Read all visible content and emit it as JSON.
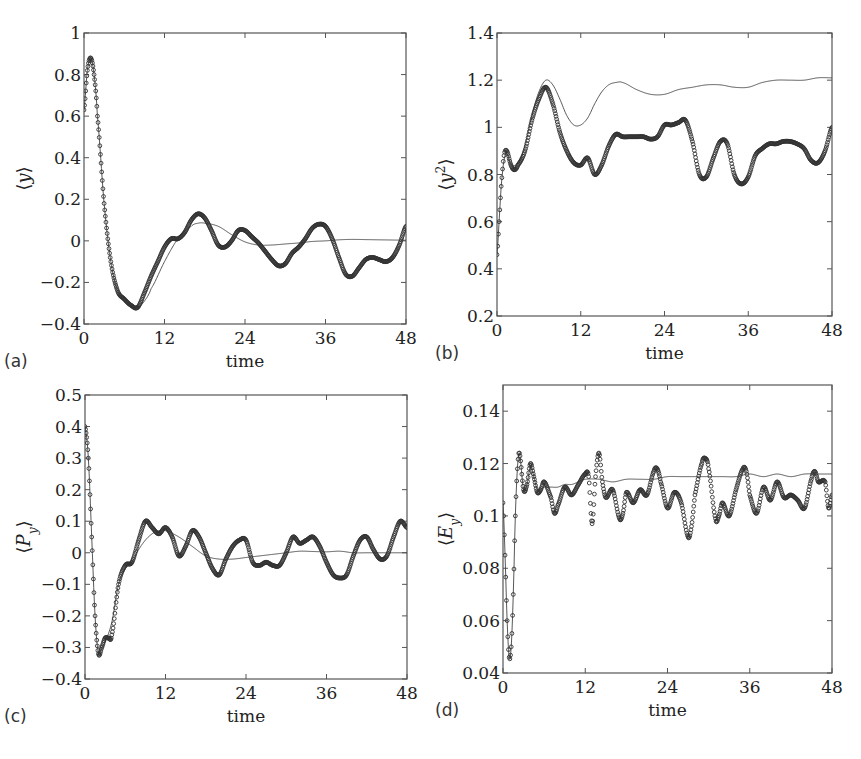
{
  "figure": {
    "background": "#ffffff",
    "axis_color": "#555555",
    "marker_color": "#333333",
    "line_color": "#444444"
  },
  "chart_data": [
    {
      "type": "line",
      "panel": "(a)",
      "title": "",
      "xlabel": "time",
      "ylabel": "⟨y⟩",
      "xlim": [
        0,
        48
      ],
      "ylim": [
        -0.4,
        1
      ],
      "xticks": [
        0,
        12,
        24,
        36,
        48
      ],
      "xtick_labels": [
        "0",
        "12",
        "24",
        "36",
        "48"
      ],
      "yticks": [
        -0.4,
        -0.2,
        0,
        0.2,
        0.4,
        0.6,
        0.8,
        1
      ],
      "ytick_labels": [
        "−0.4",
        "−0.2",
        "0",
        "0.2",
        "0.4",
        "0.6",
        "0.8",
        "1"
      ],
      "grid": false,
      "box": {
        "left": 84,
        "top": 33,
        "right": 406,
        "bottom": 324
      },
      "series": [
        {
          "name": "exact (circles)",
          "style": "markers",
          "x": [
            0,
            0.5,
            1,
            1.5,
            2,
            3,
            4,
            5,
            6,
            7,
            8,
            9,
            10,
            11,
            12,
            13,
            14,
            15,
            16,
            17,
            18,
            19,
            20,
            21,
            22,
            23,
            24,
            25,
            26,
            27,
            28,
            29,
            30,
            31,
            32,
            33,
            34,
            35,
            36,
            37,
            38,
            39,
            40,
            41,
            42,
            43,
            44,
            45,
            46,
            47,
            48
          ],
          "y": [
            0.63,
            0.82,
            0.88,
            0.8,
            0.6,
            0.18,
            -0.1,
            -0.24,
            -0.28,
            -0.31,
            -0.32,
            -0.25,
            -0.17,
            -0.1,
            -0.03,
            0.01,
            0.01,
            0.04,
            0.1,
            0.13,
            0.11,
            0.05,
            -0.02,
            -0.03,
            0.0,
            0.05,
            0.05,
            0.02,
            -0.01,
            -0.05,
            -0.09,
            -0.12,
            -0.11,
            -0.06,
            -0.03,
            0.01,
            0.06,
            0.08,
            0.07,
            0.01,
            -0.08,
            -0.16,
            -0.17,
            -0.13,
            -0.09,
            -0.08,
            -0.09,
            -0.1,
            -0.08,
            -0.02,
            0.07
          ]
        },
        {
          "name": "approximation (line)",
          "style": "line",
          "x": [
            0,
            0.5,
            1,
            1.5,
            2,
            3,
            4,
            5,
            6,
            7,
            8,
            9,
            10,
            12,
            14,
            16,
            17,
            18,
            20,
            22,
            24,
            26,
            28,
            30,
            32,
            34,
            36,
            38,
            40,
            42,
            44,
            46,
            48
          ],
          "y": [
            0.63,
            0.82,
            0.88,
            0.8,
            0.6,
            0.18,
            -0.1,
            -0.24,
            -0.28,
            -0.31,
            -0.32,
            -0.29,
            -0.23,
            -0.1,
            0.01,
            0.07,
            0.085,
            0.085,
            0.07,
            0.03,
            -0.005,
            -0.02,
            -0.02,
            -0.015,
            -0.01,
            -0.003,
            0.0,
            0.005,
            0.007,
            0.006,
            0.005,
            0.004,
            0.003
          ]
        }
      ]
    },
    {
      "type": "line",
      "panel": "(b)",
      "title": "",
      "xlabel": "time",
      "ylabel": "⟨y²⟩",
      "xlim": [
        0,
        48
      ],
      "ylim": [
        0.2,
        1.4
      ],
      "xticks": [
        0,
        12,
        24,
        36,
        48
      ],
      "xtick_labels": [
        "0",
        "12",
        "24",
        "36",
        "48"
      ],
      "yticks": [
        0.2,
        0.4,
        0.6,
        0.8,
        1,
        1.2,
        1.4
      ],
      "ytick_labels": [
        "0.2",
        "0.4",
        "0.6",
        "0.8",
        "1",
        "1.2",
        "1.4"
      ],
      "grid": false,
      "box": {
        "left": 497,
        "top": 33,
        "right": 832,
        "bottom": 316
      },
      "series": [
        {
          "name": "exact (circles)",
          "style": "markers",
          "x": [
            0,
            0.3,
            0.6,
            1,
            1.4,
            2,
            2.5,
            3,
            4,
            5,
            6,
            7,
            8,
            9,
            10,
            11,
            12,
            13,
            14,
            15,
            16,
            17,
            18,
            19,
            20,
            21,
            22,
            23,
            24,
            25,
            26,
            27,
            28,
            29,
            30,
            31,
            32,
            33,
            34,
            35,
            36,
            37,
            38,
            39,
            40,
            41,
            42,
            43,
            44,
            45,
            46,
            47,
            48
          ],
          "y": [
            0.46,
            0.6,
            0.75,
            0.88,
            0.9,
            0.84,
            0.82,
            0.84,
            0.9,
            1.03,
            1.12,
            1.17,
            1.1,
            0.98,
            0.9,
            0.85,
            0.84,
            0.87,
            0.8,
            0.84,
            0.92,
            0.97,
            0.96,
            0.96,
            0.96,
            0.96,
            0.95,
            0.96,
            1.01,
            1.01,
            1.02,
            1.03,
            0.94,
            0.8,
            0.79,
            0.87,
            0.94,
            0.93,
            0.8,
            0.76,
            0.79,
            0.88,
            0.91,
            0.93,
            0.93,
            0.94,
            0.94,
            0.93,
            0.91,
            0.86,
            0.85,
            0.9,
            1.0
          ]
        },
        {
          "name": "approximation (line)",
          "style": "line",
          "x": [
            0,
            0.3,
            0.6,
            1,
            1.4,
            2,
            3,
            4,
            5,
            6,
            7,
            8,
            9,
            10,
            11,
            12,
            13,
            14,
            15,
            16,
            17,
            18,
            20,
            22,
            24,
            26,
            28,
            30,
            32,
            34,
            36,
            38,
            40,
            42,
            44,
            46,
            48
          ],
          "y": [
            0.46,
            0.6,
            0.75,
            0.86,
            0.89,
            0.84,
            0.85,
            0.92,
            1.05,
            1.15,
            1.2,
            1.18,
            1.12,
            1.05,
            1.01,
            1.01,
            1.04,
            1.1,
            1.15,
            1.18,
            1.19,
            1.19,
            1.16,
            1.14,
            1.14,
            1.16,
            1.17,
            1.18,
            1.18,
            1.17,
            1.17,
            1.19,
            1.2,
            1.2,
            1.2,
            1.21,
            1.21
          ]
        }
      ]
    },
    {
      "type": "line",
      "panel": "(c)",
      "title": "",
      "xlabel": "time",
      "ylabel": "⟨P_y⟩",
      "xlim": [
        0,
        48
      ],
      "ylim": [
        -0.4,
        0.5
      ],
      "xticks": [
        0,
        12,
        24,
        36,
        48
      ],
      "xtick_labels": [
        "0",
        "12",
        "24",
        "36",
        "48"
      ],
      "yticks": [
        -0.4,
        -0.3,
        -0.2,
        -0.1,
        0,
        0.1,
        0.2,
        0.3,
        0.4,
        0.5
      ],
      "ytick_labels": [
        "−0.4",
        "−0.3",
        "−0.2",
        "−0.1",
        "0",
        "0.1",
        "0.2",
        "0.3",
        "0.4",
        "0.5"
      ],
      "grid": false,
      "box": {
        "left": 85,
        "top": 395,
        "right": 407,
        "bottom": 679
      },
      "series": [
        {
          "name": "exact (circles)",
          "style": "markers",
          "x": [
            0,
            0.5,
            1,
            1.5,
            2,
            2.5,
            3,
            3.5,
            4,
            5,
            6,
            7,
            8,
            9,
            10,
            11,
            12,
            13,
            14,
            15,
            16,
            17,
            18,
            19,
            20,
            21,
            22,
            23,
            24,
            25,
            26,
            27,
            28,
            29,
            30,
            31,
            32,
            33,
            34,
            35,
            36,
            37,
            38,
            39,
            40,
            41,
            42,
            43,
            44,
            45,
            46,
            47,
            48
          ],
          "y": [
            0.4,
            0.3,
            0.05,
            -0.2,
            -0.32,
            -0.3,
            -0.27,
            -0.27,
            -0.26,
            -0.1,
            -0.04,
            -0.03,
            0.04,
            0.1,
            0.08,
            0.06,
            0.08,
            0.05,
            -0.01,
            0.02,
            0.07,
            0.05,
            0.0,
            -0.05,
            -0.07,
            -0.02,
            0.02,
            0.04,
            0.04,
            -0.03,
            -0.04,
            -0.03,
            -0.04,
            -0.04,
            0.0,
            0.05,
            0.03,
            0.04,
            0.05,
            0.02,
            -0.03,
            -0.07,
            -0.08,
            -0.07,
            -0.01,
            0.04,
            0.05,
            0.01,
            -0.02,
            -0.01,
            0.05,
            0.1,
            0.08
          ]
        },
        {
          "name": "approximation (line)",
          "style": "line",
          "x": [
            0,
            0.5,
            1,
            1.5,
            2,
            2.5,
            3,
            4,
            5,
            6,
            7,
            8,
            9,
            10,
            11,
            12,
            14,
            16,
            18,
            20,
            22,
            24,
            26,
            28,
            30,
            32,
            34,
            36,
            38,
            40,
            42,
            44,
            46,
            48
          ],
          "y": [
            0.4,
            0.3,
            0.05,
            -0.2,
            -0.32,
            -0.3,
            -0.28,
            -0.22,
            -0.1,
            -0.05,
            -0.03,
            0.01,
            0.04,
            0.06,
            0.07,
            0.07,
            0.05,
            0.02,
            -0.01,
            -0.02,
            -0.02,
            -0.015,
            -0.01,
            -0.005,
            0.0,
            0.005,
            0.004,
            0.003,
            0.005,
            0.0,
            0.0,
            0.0,
            0.0,
            0.0
          ]
        }
      ]
    },
    {
      "type": "line",
      "panel": "(d)",
      "title": "",
      "xlabel": "time",
      "ylabel": "⟨E_y⟩",
      "xlim": [
        0,
        48
      ],
      "ylim": [
        0.04,
        0.15
      ],
      "xticks": [
        0,
        12,
        24,
        36,
        48
      ],
      "xtick_labels": [
        "0",
        "12",
        "24",
        "36",
        "48"
      ],
      "yticks": [
        0.04,
        0.06,
        0.08,
        0.1,
        0.12,
        0.14
      ],
      "ytick_labels": [
        "0.04",
        "0.06",
        "0.08",
        "0.1",
        "0.12",
        "0.14"
      ],
      "grid": false,
      "box": {
        "left": 503,
        "top": 385,
        "right": 832,
        "bottom": 673
      },
      "series": [
        {
          "name": "exact (circles)",
          "style": "markers",
          "x": [
            0,
            0.3,
            0.6,
            0.9,
            1.2,
            1.5,
            1.8,
            2.1,
            2.4,
            3,
            3.5,
            4,
            4.5,
            5,
            5.5,
            6,
            7,
            7.5,
            8,
            9,
            10,
            11,
            12,
            12.5,
            13,
            13.5,
            14,
            14.5,
            15,
            16,
            17,
            17.5,
            18,
            19,
            20,
            21,
            22,
            22.5,
            23,
            24,
            25,
            26,
            27,
            27.5,
            28,
            29,
            29.5,
            30,
            31,
            31.5,
            32,
            33,
            34,
            35,
            35.5,
            36,
            37,
            38,
            39,
            40,
            41,
            42,
            43,
            44,
            45,
            45.5,
            46,
            47,
            47.5,
            48
          ],
          "y": [
            0.105,
            0.085,
            0.06,
            0.046,
            0.05,
            0.07,
            0.1,
            0.118,
            0.124,
            0.11,
            0.112,
            0.12,
            0.115,
            0.109,
            0.11,
            0.113,
            0.107,
            0.101,
            0.104,
            0.111,
            0.108,
            0.112,
            0.116,
            0.115,
            0.097,
            0.115,
            0.124,
            0.113,
            0.107,
            0.11,
            0.099,
            0.101,
            0.109,
            0.105,
            0.11,
            0.108,
            0.117,
            0.118,
            0.113,
            0.103,
            0.109,
            0.105,
            0.092,
            0.096,
            0.108,
            0.12,
            0.122,
            0.118,
            0.099,
            0.1,
            0.105,
            0.1,
            0.11,
            0.118,
            0.117,
            0.108,
            0.101,
            0.111,
            0.106,
            0.113,
            0.107,
            0.108,
            0.106,
            0.103,
            0.114,
            0.117,
            0.113,
            0.113,
            0.103,
            0.108
          ]
        },
        {
          "name": "approximation (line)",
          "style": "line",
          "x": [
            0,
            0.3,
            0.6,
            0.9,
            1.2,
            1.5,
            1.8,
            2.1,
            2.4,
            3,
            3.5,
            4,
            4.5,
            5,
            6,
            7,
            8,
            9,
            10,
            11,
            12,
            14,
            16,
            18,
            20,
            22,
            24,
            26,
            28,
            30,
            32,
            34,
            36,
            38,
            40,
            42,
            44,
            46,
            48
          ],
          "y": [
            0.105,
            0.085,
            0.06,
            0.046,
            0.05,
            0.07,
            0.1,
            0.118,
            0.124,
            0.11,
            0.112,
            0.119,
            0.115,
            0.11,
            0.111,
            0.111,
            0.111,
            0.112,
            0.112,
            0.113,
            0.114,
            0.114,
            0.113,
            0.114,
            0.114,
            0.114,
            0.115,
            0.115,
            0.115,
            0.115,
            0.115,
            0.115,
            0.116,
            0.115,
            0.116,
            0.115,
            0.116,
            0.116,
            0.116
          ]
        }
      ]
    }
  ]
}
